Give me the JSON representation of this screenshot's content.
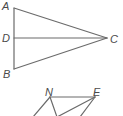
{
  "figure1": {
    "labels": {
      "A": "A",
      "B": "B",
      "C": "C",
      "D": "D"
    },
    "segments": [
      "AB",
      "AC",
      "DC",
      "BC"
    ]
  },
  "figure2": {
    "labels": {
      "N": "N",
      "E": "E"
    },
    "segments": [
      "NE",
      "N-lowerleft",
      "N-bottom",
      "E-bottom",
      "E-lowerright"
    ]
  },
  "colors": {
    "line": "#6b6b6b",
    "label": "#4a4a4a",
    "background": "#ffffff"
  }
}
